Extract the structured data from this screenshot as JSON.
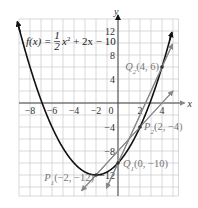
{
  "chart_data": {
    "type": "line",
    "title": "",
    "function_label": "f(x) = 1/2 x^2 + 2x - 10",
    "function_parts": {
      "fx": "f(x) = ",
      "num": "1",
      "den": "2",
      "rest": "x",
      "exp": "2",
      "tail": " + 2x − 10"
    },
    "xlabel": "x",
    "ylabel": "y",
    "xlim": [
      -9,
      5.5
    ],
    "ylim": [
      -15.5,
      14
    ],
    "grid": true,
    "x_ticks": [
      -8,
      -6,
      -4,
      -2,
      0,
      2,
      4
    ],
    "x_tick_labels": [
      "−8",
      "−6",
      "−4",
      "−2",
      "0",
      "2",
      "4"
    ],
    "y_ticks": [
      12,
      8,
      4,
      -4,
      -8,
      -12
    ],
    "y_tick_labels": [
      "12",
      "8",
      "4",
      "−4",
      "−8",
      "−12"
    ],
    "series": [
      {
        "name": "f(x)",
        "kind": "parabola",
        "a": 0.5,
        "b": 2,
        "c": -10,
        "color": "#111111"
      },
      {
        "name": "secant P1P2",
        "kind": "line",
        "slope": 2,
        "intercept": -8,
        "color": "#888888"
      },
      {
        "name": "secant Q1Q2",
        "kind": "line",
        "slope": 4,
        "intercept": -10,
        "color": "#888888"
      }
    ],
    "points": [
      {
        "label": "P1(−2, −12)",
        "name": "P",
        "sub": "1",
        "coords": "(−2, −12)",
        "x": -2,
        "y": -12
      },
      {
        "label": "P2(2, −4)",
        "name": "P",
        "sub": "2",
        "coords": "(2, −4)",
        "x": 2,
        "y": -4
      },
      {
        "label": "Q1(0, −10)",
        "name": "Q",
        "sub": "1",
        "coords": "(0, −10)",
        "x": 0,
        "y": -10
      },
      {
        "label": "Q2(4, 6)",
        "name": "Q",
        "sub": "2",
        "coords": "(4, 6)",
        "x": 4,
        "y": 6
      }
    ]
  }
}
